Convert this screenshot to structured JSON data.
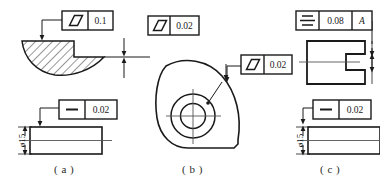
{
  "drawing": {
    "title": "Geometric tolerance callout examples",
    "background_color": "#ffffff",
    "line_color": "#1a1a1a",
    "thin_line_color": "#555555"
  },
  "figures": [
    {
      "id": "a",
      "caption": "( a )",
      "frames": [
        {
          "name": "flatness-frame-a-top",
          "symbol": "parallelogram-flatness-icon",
          "tolerance": "0.1",
          "datum": ""
        },
        {
          "name": "straightness-frame-a-bottom",
          "symbol": "dash-straightness-icon",
          "tolerance": "0.02",
          "datum": ""
        }
      ],
      "dimensions": [
        {
          "name": "diameter-15-a",
          "label": "ø15"
        }
      ]
    },
    {
      "id": "b",
      "caption": "( b )",
      "frames": [
        {
          "name": "flatness-frame-a-right",
          "symbol": "parallelogram-flatness-icon",
          "tolerance": "0.02",
          "datum": ""
        },
        {
          "name": "flatness-frame-b",
          "symbol": "parallelogram-flatness-icon",
          "tolerance": "0.02",
          "datum": ""
        }
      ],
      "dimensions": []
    },
    {
      "id": "c",
      "caption": "( c )",
      "frames": [
        {
          "name": "symmetry-frame-c-top",
          "symbol": "symmetry-icon",
          "tolerance": "0.08",
          "datum": "A"
        },
        {
          "name": "straightness-frame-c-bottom",
          "symbol": "dash-straightness-icon",
          "tolerance": "0.02",
          "datum": ""
        }
      ],
      "dimensions": [
        {
          "name": "diameter-15-c",
          "label": "ø15"
        }
      ]
    }
  ],
  "labels": {
    "tol_a_top": "0.1",
    "tol_a_bottom": "0.02",
    "tol_a_right": "0.02",
    "tol_b": "0.02",
    "tol_c_top": "0.08",
    "datum_c": "A",
    "tol_c_bottom": "0.02",
    "dia_a": "ø15",
    "dia_c": "ø15",
    "cap_a": "( a )",
    "cap_b": "( b )",
    "cap_c": "( c )"
  }
}
